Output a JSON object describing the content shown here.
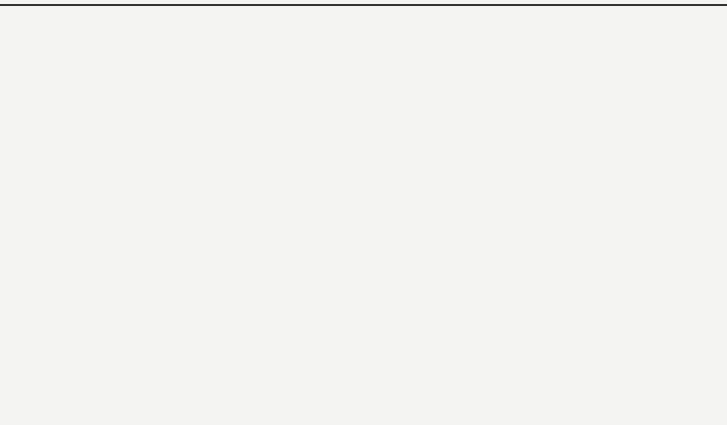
{
  "chart_data": {
    "type": "pie",
    "style": "3d",
    "title": "",
    "categories": [
      "3人以下",
      "3—10人",
      "10—30人",
      "30—50人",
      "50—60人",
      "70人以上"
    ],
    "values": [
      1,
      23,
      45,
      21,
      6,
      4
    ],
    "value_labels": [
      "1%",
      "23%",
      "45%",
      "21%",
      "6%",
      "4%"
    ],
    "fills": [
      "#2a2a2a",
      "#8c8c8c",
      "#c4c4c4",
      "#5e5e5e",
      "hatch-diagonal",
      "dots-light"
    ],
    "start_angle_deg": 0,
    "direction": "clockwise",
    "legend": "none",
    "labels_outside": true
  },
  "labels": [
    {
      "cat": "3人以下",
      "pct": "1%",
      "x": 440,
      "y": 34
    },
    {
      "cat": "3—10人",
      "pct": "23%",
      "x": 633,
      "y": 88
    },
    {
      "cat": "10—30人",
      "pct": "45%",
      "x": 648,
      "y": 342
    },
    {
      "cat": "30—50人",
      "pct": "21%",
      "x": 75,
      "y": 104
    },
    {
      "cat": "50—60人",
      "pct": "6%",
      "x": 212,
      "y": 56
    },
    {
      "cat": "70人以上",
      "pct": "4%",
      "x": 315,
      "y": 40
    }
  ],
  "leader": {
    "x1": 373,
    "y1": 100,
    "x2": 422,
    "y2": 44
  }
}
